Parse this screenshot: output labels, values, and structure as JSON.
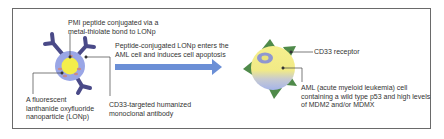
{
  "figure": {
    "labels": {
      "pmi_peptide": [
        "PMI peptide conjugated via a",
        "metal-thiolate bond to LONp"
      ],
      "peptide_conjugated": [
        "Peptide-conjugated LONp enters the",
        "AML cell and induces cell apoptosis"
      ],
      "nanoparticle": [
        "A fluorescent",
        "lanthanide oxyfluoride",
        "nanoparticle (LONp)"
      ],
      "antibody": [
        "CD33-targeted humanized",
        "monoclonal antibody"
      ],
      "receptor": [
        "CD33 receptor"
      ],
      "aml_cell": [
        "AML (acute myeloid leukemia) cell",
        "containing a wild type p53 and high levels",
        "of MDM2 and/or MDMX"
      ]
    },
    "colors": {
      "frame": "#6a6a6a",
      "nanoparticle_shell": "#9aa6e6",
      "nanoparticle_core": "#f4ee4a",
      "peptide_specks": "#c98a8a",
      "antibody": "#4a4a88",
      "arrow": "#6b8fd6",
      "cell_yellow": "#f3ec8a",
      "cell_blue": "#a9b7e8",
      "nucleus_outer": "#8f97d0",
      "nucleus_inner": "#e9e27a",
      "receptor": "#4f8a4a",
      "leader_line": "#444444"
    }
  }
}
